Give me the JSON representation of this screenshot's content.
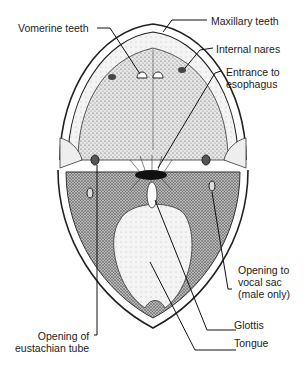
{
  "diagram": {
    "labels": {
      "vomerine_teeth": "Vomerine teeth",
      "maxillary_teeth": "Maxillary teeth",
      "internal_nares": "Internal nares",
      "entrance_esophagus": "Entrance to\nesophagus",
      "opening_vocal_sac": "Opening to\nvocal sac\n(male only)",
      "glottis": "Glottis",
      "tongue": "Tongue",
      "opening_eustachian": "Opening of\neustachian tube"
    }
  }
}
